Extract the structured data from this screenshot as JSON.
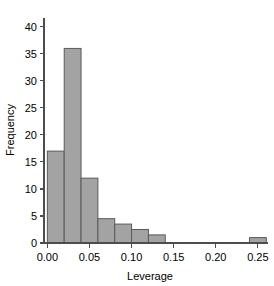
{
  "chart_data": {
    "type": "bar",
    "title": "",
    "subtitle": "",
    "xlabel": "Leverage",
    "ylabel": "Frequency",
    "xlim": [
      -0.004,
      0.262
    ],
    "ylim": [
      0,
      42
    ],
    "grid": false,
    "legend": null,
    "annotations": [],
    "bin_width": 0.02,
    "bin_edges": [
      0.0,
      0.02,
      0.04,
      0.06,
      0.08,
      0.1,
      0.12,
      0.14,
      0.16,
      0.18,
      0.2,
      0.22,
      0.24,
      0.26
    ],
    "categories": [
      "0.00-0.02",
      "0.02-0.04",
      "0.04-0.06",
      "0.06-0.08",
      "0.08-0.10",
      "0.10-0.12",
      "0.12-0.14",
      "0.14-0.16",
      "0.16-0.18",
      "0.18-0.20",
      "0.20-0.22",
      "0.22-0.24",
      "0.24-0.26"
    ],
    "values": [
      17,
      36,
      12,
      4.5,
      3.5,
      2.5,
      1.5,
      0,
      0,
      0,
      0,
      0,
      1
    ],
    "x_ticks": [
      0.0,
      0.05,
      0.1,
      0.15,
      0.2,
      0.25
    ],
    "x_tick_labels": [
      "0.00",
      "0.05",
      "0.10",
      "0.15",
      "0.20",
      "0.25"
    ],
    "y_ticks": [
      0,
      5,
      10,
      15,
      20,
      25,
      30,
      35,
      40
    ],
    "y_tick_labels": [
      "0",
      "5",
      "10",
      "15",
      "20",
      "25",
      "30",
      "35",
      "40"
    ],
    "colors": {
      "bar_fill": "#a3a3a3",
      "bar_stroke": "#5a5a5a",
      "axis": "#4d4d4d",
      "text": "#000000",
      "background": "#ffffff"
    }
  }
}
